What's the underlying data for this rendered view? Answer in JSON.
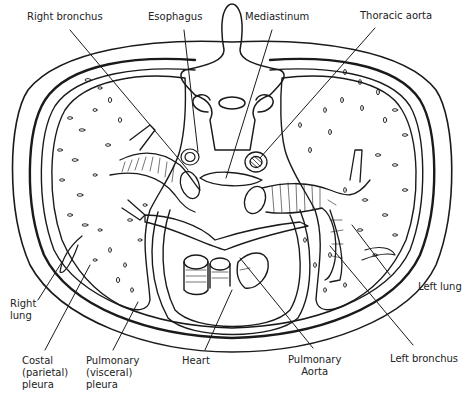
{
  "figure": {
    "labels": {
      "right_bronchus": "Right bronchus",
      "esophagus": "Esophagus",
      "mediastinum": "Mediastinum",
      "thoracic_aorta": "Thoracic aorta",
      "left_lung": "Left lung",
      "right_lung": [
        "Right",
        "lung"
      ],
      "costal_pleura": [
        "Costal",
        "(parietal)",
        "pleura"
      ],
      "pulmonary_pleura": [
        "Pulmonary",
        "(visceral)",
        "pleura"
      ],
      "heart": "Heart",
      "pulmonary_aorta": [
        "Pulmonary",
        "Aorta"
      ],
      "left_bronchus": "Left bronchus"
    },
    "colors": {
      "ink": "#1a1a1a",
      "background": "#ffffff",
      "text": "#222222"
    }
  }
}
